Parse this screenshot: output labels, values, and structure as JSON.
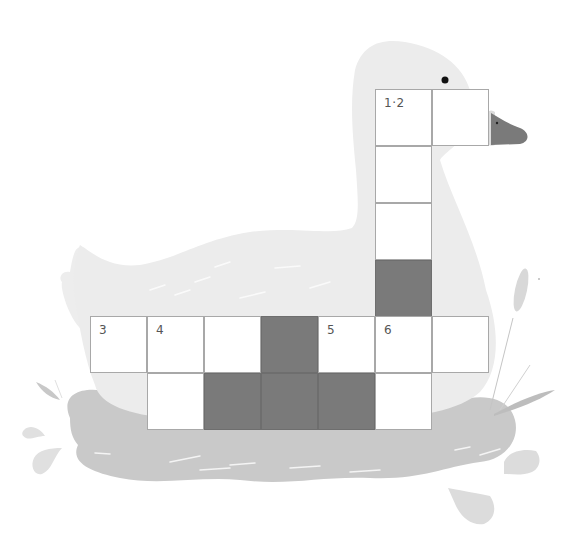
{
  "colors": {
    "duck_body": "#ececec",
    "water": "#c9c9c9",
    "beak": "#7a7a7a",
    "block_cell": "#7a7a7a",
    "cell_border": "#a8a8a8",
    "white_cell": "#ffffff"
  },
  "grid": {
    "cell_size": 57,
    "origin_x": 90,
    "origin_y": 89,
    "cells": [
      {
        "row": 0,
        "col": 5,
        "type": "white",
        "number": "1·2"
      },
      {
        "row": 0,
        "col": 6,
        "type": "white",
        "number": ""
      },
      {
        "row": 1,
        "col": 5,
        "type": "white",
        "number": ""
      },
      {
        "row": 2,
        "col": 5,
        "type": "white",
        "number": ""
      },
      {
        "row": 3,
        "col": 5,
        "type": "block",
        "number": ""
      },
      {
        "row": 4,
        "col": 0,
        "type": "white",
        "number": "3"
      },
      {
        "row": 4,
        "col": 1,
        "type": "white",
        "number": "4"
      },
      {
        "row": 4,
        "col": 2,
        "type": "white",
        "number": ""
      },
      {
        "row": 4,
        "col": 3,
        "type": "block",
        "number": ""
      },
      {
        "row": 4,
        "col": 4,
        "type": "white",
        "number": "5"
      },
      {
        "row": 4,
        "col": 5,
        "type": "white",
        "number": "6"
      },
      {
        "row": 4,
        "col": 6,
        "type": "white",
        "number": ""
      },
      {
        "row": 5,
        "col": 1,
        "type": "white",
        "number": ""
      },
      {
        "row": 5,
        "col": 2,
        "type": "block",
        "number": ""
      },
      {
        "row": 5,
        "col": 3,
        "type": "block",
        "number": ""
      },
      {
        "row": 5,
        "col": 4,
        "type": "block",
        "number": ""
      },
      {
        "row": 5,
        "col": 5,
        "type": "white",
        "number": ""
      }
    ]
  }
}
